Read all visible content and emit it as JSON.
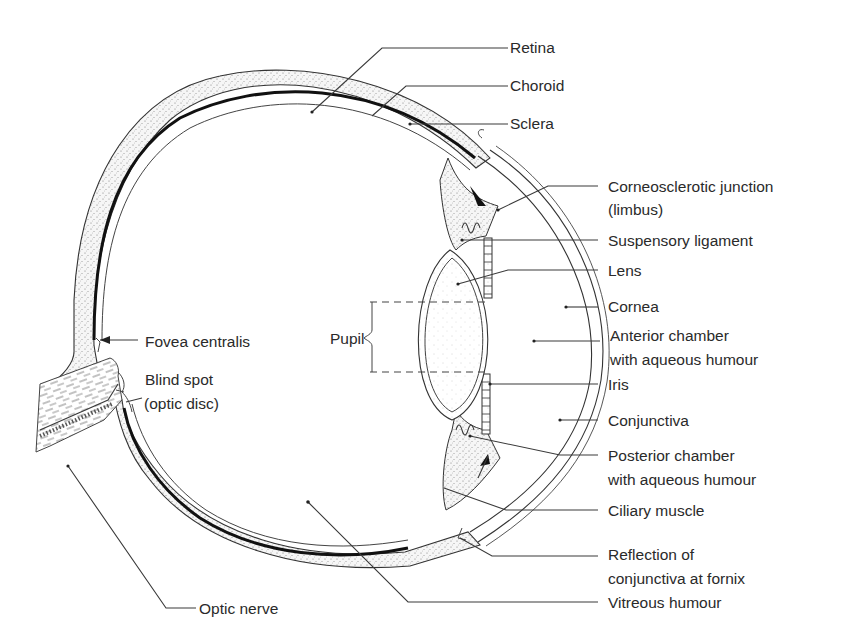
{
  "diagram": {
    "colors": {
      "line": "#3a3a3a",
      "stipple_bg": "#f4f4f4",
      "choroid": "#111111",
      "text": "#2a2a2a"
    }
  },
  "labels": {
    "retina": "Retina",
    "choroid": "Choroid",
    "sclera": "Sclera",
    "limbus_line1": "Corneosclerotic junction",
    "limbus_line2": "(limbus)",
    "suspensory_ligament": "Suspensory ligament",
    "lens": "Lens",
    "cornea": "Cornea",
    "anterior_line1": "Anterior chamber",
    "anterior_line2": "with aqueous humour",
    "iris": "Iris",
    "conjunctiva": "Conjunctiva",
    "posterior_line1": "Posterior chamber",
    "posterior_line2": "with aqueous humour",
    "ciliary_muscle": "Ciliary muscle",
    "reflection_line1": "Reflection of",
    "reflection_line2": "conjunctiva at fornix",
    "vitreous": "Vitreous humour",
    "fovea": "Fovea centralis",
    "blind_line1": "Blind spot",
    "blind_line2": "(optic disc)",
    "pupil": "Pupil",
    "optic_nerve": "Optic nerve"
  }
}
